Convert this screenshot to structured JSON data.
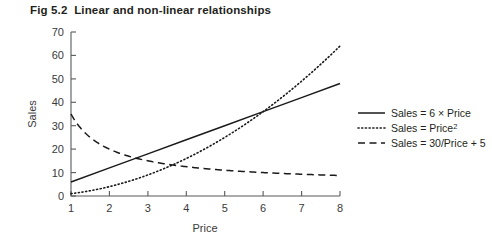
{
  "figure": {
    "title": "Fig 5.2  Linear and non-linear relationships"
  },
  "chart_data": {
    "type": "line",
    "title": "Fig 5.2  Linear and non-linear relationships",
    "xlabel": "Price",
    "ylabel": "Sales",
    "xlim": [
      1,
      8
    ],
    "ylim": [
      0,
      70
    ],
    "xticks": [
      1,
      2,
      3,
      4,
      5,
      6,
      7,
      8
    ],
    "yticks": [
      0,
      10,
      20,
      30,
      40,
      50,
      60,
      70
    ],
    "xtick_labels": [
      "1",
      "2",
      "3",
      "4",
      "5",
      "6",
      "7",
      "8"
    ],
    "ytick_labels": [
      "0",
      "10",
      "20",
      "30",
      "40",
      "50",
      "60",
      "70"
    ],
    "grid": false,
    "legend_position": "right",
    "x": [
      1,
      2,
      3,
      4,
      5,
      6,
      7,
      8
    ],
    "series": [
      {
        "name": "Sales = 6 × Price",
        "style": "solid",
        "color": "#1a1a1a",
        "values": [
          6,
          12,
          18,
          24,
          30,
          36,
          42,
          48
        ]
      },
      {
        "name": "Sales = Price²",
        "style": "dotted",
        "color": "#1a1a1a",
        "values": [
          1,
          4,
          9,
          16,
          25,
          36,
          49,
          64
        ]
      },
      {
        "name": "Sales = 30/Price + 5",
        "style": "dashed",
        "color": "#1a1a1a",
        "values": [
          35,
          20,
          15,
          12.5,
          11,
          10,
          9.29,
          8.75
        ]
      }
    ]
  },
  "legend": {
    "items": [
      {
        "label": "Sales = 6 × Price",
        "style": "solid"
      },
      {
        "label_main": "Sales = Price",
        "label_sup": "2",
        "style": "dotted"
      },
      {
        "label": "Sales = 30/Price + 5",
        "style": "dashed"
      }
    ]
  },
  "axes": {
    "x_title": "Price",
    "y_title": "Sales"
  }
}
